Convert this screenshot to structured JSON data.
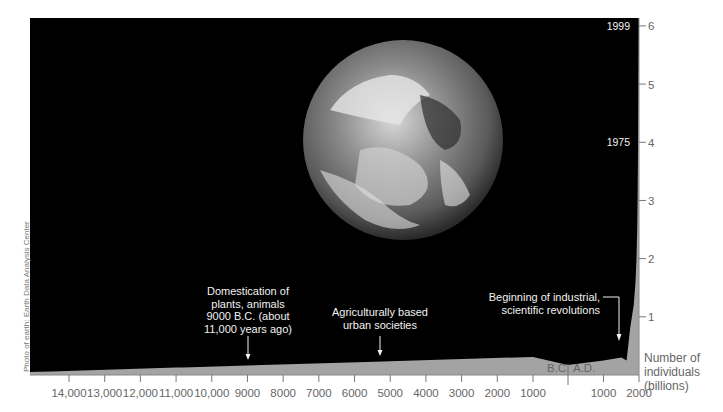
{
  "chart_data": {
    "type": "area",
    "title": "",
    "xlabel": "",
    "ylabel": "Number of individuals (billions)",
    "ylim": [
      0,
      6
    ],
    "xlim": [
      -14500,
      2000
    ],
    "grid": false,
    "legend": null,
    "x_ticks": [
      {
        "value": -14000,
        "label": "14,000"
      },
      {
        "value": -13000,
        "label": "13,000"
      },
      {
        "value": -12000,
        "label": "12,000"
      },
      {
        "value": -11000,
        "label": "11,000"
      },
      {
        "value": -10000,
        "label": "10,000"
      },
      {
        "value": -9000,
        "label": "9000"
      },
      {
        "value": -8000,
        "label": "8000"
      },
      {
        "value": -7000,
        "label": "7000"
      },
      {
        "value": -6000,
        "label": "6000"
      },
      {
        "value": -5000,
        "label": "5000"
      },
      {
        "value": -4000,
        "label": "4000"
      },
      {
        "value": -3000,
        "label": "3000"
      },
      {
        "value": -2000,
        "label": "2000"
      },
      {
        "value": -1000,
        "label": "1000"
      },
      {
        "value": 1000,
        "label": "1000"
      },
      {
        "value": 2000,
        "label": "2000"
      }
    ],
    "era_labels": {
      "bc": "B.C.",
      "ad": "A.D."
    },
    "y_ticks": [
      {
        "value": 1,
        "label": "1"
      },
      {
        "value": 2,
        "label": "2"
      },
      {
        "value": 3,
        "label": "3"
      },
      {
        "value": 4,
        "label": "4"
      },
      {
        "value": 5,
        "label": "5"
      },
      {
        "value": 6,
        "label": "6"
      }
    ],
    "series": [
      {
        "name": "World human population",
        "x": [
          -14500,
          -11000,
          -10800,
          -9000,
          -5200,
          -5000,
          -1000,
          0,
          1000,
          1500,
          1650,
          1750,
          1800,
          1850,
          1900,
          1930,
          1950,
          1960,
          1975,
          1987,
          1999
        ],
        "values": [
          0.0,
          0.03,
          0.05,
          0.06,
          0.08,
          0.09,
          0.12,
          0.17,
          0.25,
          0.3,
          0.25,
          0.8,
          1.0,
          1.2,
          1.6,
          2.0,
          2.5,
          3.0,
          4.0,
          5.0,
          6.0
        ]
      }
    ],
    "annotations": [
      {
        "x": -9000,
        "text": [
          "Domestication of",
          "plants, animals",
          "9000 B.C. (about",
          "11,000 years ago)"
        ]
      },
      {
        "x": -5200,
        "text": [
          "Agriculturally based",
          "urban societies"
        ]
      },
      {
        "x": 1650,
        "text": [
          "Beginning of industrial,",
          "scientific revolutions"
        ]
      },
      {
        "y": 4,
        "text": "1975"
      },
      {
        "y": 6,
        "text": "1999"
      }
    ],
    "ylabel_lines": [
      "Number of",
      "individuals",
      "(billions)"
    ],
    "credit": "Photo of earth: Earth Data Analysis Center",
    "colors": {
      "background_panel": "#000000",
      "area_fill": "#a3a3a3",
      "axis": "#777777",
      "annotation_text": "#f2f2f2"
    }
  }
}
